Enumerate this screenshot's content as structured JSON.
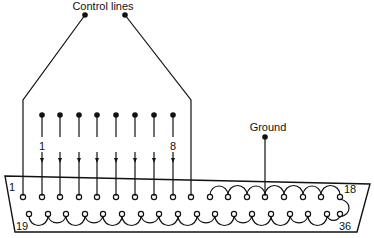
{
  "diagram": {
    "title_label": "Control lines",
    "ground_label": "Ground",
    "pin_labels": {
      "first_control": "1",
      "last_control": "8",
      "connector_top_left": "1",
      "connector_top_right": "18",
      "connector_bottom_left": "19",
      "connector_bottom_right": "36"
    },
    "control_line_count": 8,
    "top_row_pins": 18,
    "bottom_row_pins": 18,
    "colors": {
      "ink": "#111111",
      "background": "#ffffff"
    }
  }
}
